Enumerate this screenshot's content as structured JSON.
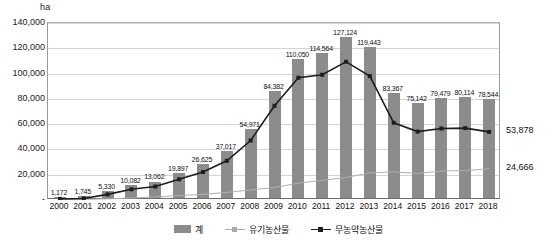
{
  "unit": "ha",
  "chart_data": {
    "type": "bar",
    "title": "",
    "xlabel": "",
    "ylabel": "ha",
    "ylim": [
      0,
      140000
    ],
    "ytick_labels": [
      "140,000",
      "120,000",
      "100,000",
      "80,000",
      "60,000",
      "40,000",
      "20,000",
      "-"
    ],
    "ytick_values": [
      140000,
      120000,
      100000,
      80000,
      60000,
      40000,
      20000,
      0
    ],
    "grid": true,
    "legend_position": "bottom",
    "categories": [
      "2000",
      "2001",
      "2002",
      "2003",
      "2004",
      "2005",
      "2006",
      "2007",
      "2008",
      "2009",
      "2010",
      "2011",
      "2012",
      "2013",
      "2014",
      "2015",
      "2016",
      "2017",
      "2018"
    ],
    "series": [
      {
        "name": "계",
        "kind": "bar",
        "color": "#8c8c8c",
        "values": [
          1172,
          1745,
          5330,
          10082,
          13062,
          19897,
          26625,
          37017,
          54971,
          84382,
          110050,
          114564,
          127124,
          119443,
          83367,
          75142,
          79479,
          80114,
          78544
        ],
        "labels": [
          "1,172",
          "1,745",
          "5,330",
          "10,082",
          "13,062",
          "19,897",
          "26,625",
          "37,017",
          "54,971",
          "84,382",
          "110,050",
          "114,564",
          "127,124",
          "119,443",
          "83,367",
          "75,142",
          "79,479",
          "80,114",
          "78,544"
        ]
      },
      {
        "name": "유기농산물",
        "kind": "line",
        "color": "#b0b0b0",
        "values": [
          296,
          500,
          900,
          1600,
          2400,
          3500,
          4500,
          6000,
          7900,
          9900,
          13343,
          15517,
          17812,
          21438,
          22277,
          21019,
          22936,
          23277,
          24666
        ],
        "end_label": "24,666"
      },
      {
        "name": "무농약농산물",
        "kind": "line",
        "color": "#1e1e1e",
        "values": [
          876,
          1245,
          4430,
          8482,
          10662,
          16397,
          22125,
          31017,
          47071,
          74482,
          96707,
          99047,
          109312,
          98005,
          61090,
          54123,
          56543,
          56837,
          53878
        ],
        "end_label": "53,878"
      }
    ]
  },
  "legend": [
    {
      "label": "계",
      "marker": "bar-swatch",
      "color": "#8c8c8c"
    },
    {
      "label": "유기농산물",
      "marker": "line-swatch",
      "color": "#a8a8a8"
    },
    {
      "label": "무농약농산물",
      "marker": "line-swatch",
      "color": "#1e1e1e"
    }
  ]
}
